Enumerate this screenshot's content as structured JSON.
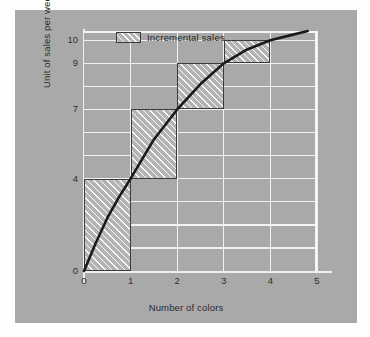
{
  "figure": {
    "background_color": "#ffffff",
    "card_color": "#a9a9a9",
    "grid_color": "#f2f2f2",
    "curve_color": "#1a1a1a",
    "hatch_border_color": "#3b3b3b"
  },
  "legend": {
    "position": "top-left-inside",
    "swatch_name": "hatched-swatch",
    "label": "Incremental sales"
  },
  "chart_data": {
    "type": "line",
    "title": "",
    "subtitle": "",
    "xlabel": "Number of colors",
    "ylabel": "Unit of sales per week",
    "xlim": [
      0,
      5
    ],
    "ylim": [
      0,
      10.4
    ],
    "grid": true,
    "x_ticks": [
      "0",
      "1",
      "2",
      "3",
      "4",
      "5"
    ],
    "x_tick_values": [
      0,
      1,
      2,
      3,
      4,
      5
    ],
    "y_ticks": [
      "0",
      "4",
      "7",
      "9",
      "10"
    ],
    "y_tick_values": [
      0,
      4,
      7,
      9,
      10
    ],
    "gridlines_y": [
      1,
      2,
      3,
      4,
      5,
      6,
      7,
      8,
      9,
      10
    ],
    "series": [
      {
        "name": "Total sales response curve",
        "type": "line",
        "x": [
          0,
          0.25,
          0.5,
          0.75,
          1,
          1.5,
          2,
          2.5,
          3,
          3.5,
          4,
          4.4,
          4.8
        ],
        "y": [
          0,
          1.2,
          2.3,
          3.2,
          4.0,
          5.7,
          7.0,
          8.1,
          9.0,
          9.6,
          10.0,
          10.2,
          10.4
        ]
      },
      {
        "name": "Incremental sales",
        "type": "step-blocks",
        "blocks": [
          {
            "x_from": 0,
            "x_to": 1,
            "y_from": 0,
            "y_to": 4,
            "increment": 4
          },
          {
            "x_from": 1,
            "x_to": 2,
            "y_from": 4,
            "y_to": 7,
            "increment": 3
          },
          {
            "x_from": 2,
            "x_to": 3,
            "y_from": 7,
            "y_to": 9,
            "increment": 2
          },
          {
            "x_from": 3,
            "x_to": 4,
            "y_from": 9,
            "y_to": 10,
            "increment": 1
          }
        ]
      }
    ],
    "annotations": []
  }
}
